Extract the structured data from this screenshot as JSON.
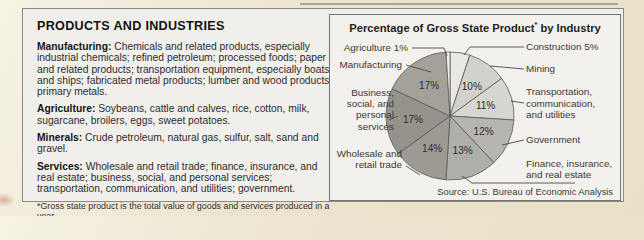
{
  "left_panel": {
    "heading": "PRODUCTS AND INDUSTRIES",
    "sections": [
      {
        "label": "Manufacturing:",
        "text": "Chemicals and related products, especially industrial chemicals; refined petroleum; processed foods; paper and related products; transportation equipment, especially boats and ships; fabricated metal products; lumber and wood products; primary metals."
      },
      {
        "label": "Agriculture:",
        "text": "Soybeans, cattle and calves, rice, cotton, milk, sugarcane, broilers, eggs, sweet potatoes."
      },
      {
        "label": "Minerals:",
        "text": "Crude petroleum, natural gas, sulfur, salt, sand and gravel."
      },
      {
        "label": "Services:",
        "text": "Wholesale and retail trade; finance, insurance, and real estate; business, social, and personal services; transportation, communication, and utilities; government."
      }
    ],
    "footnote": "*Gross state product is the total value of goods and services produced in a year."
  },
  "chart_panel": {
    "title_main": "Percentage of Gross State Product",
    "title_sup": "*",
    "title_rest": " by Industry",
    "source": "Source: U.S. Bureau of Economic Analysis"
  },
  "chart_data": {
    "type": "pie",
    "start_angle_deg": 0,
    "direction": "clockwise",
    "legend_position": "callout-labels",
    "slices": [
      {
        "label": "Construction",
        "value": 5,
        "pct_label": "",
        "external_lines": [
          "Construction 5%"
        ],
        "color": "#eae8e3"
      },
      {
        "label": "Mining",
        "value": 10,
        "pct_label": "10%",
        "external_lines": [
          "Mining"
        ],
        "color": "#d3d1cb"
      },
      {
        "label": "Transportation, communication, and utilities",
        "value": 11,
        "pct_label": "11%",
        "external_lines": [
          "Transportation,",
          "communication,",
          "and utilities"
        ],
        "color": "#d8d6d0"
      },
      {
        "label": "Government",
        "value": 12,
        "pct_label": "12%",
        "external_lines": [
          "Government"
        ],
        "color": "#b7b5af"
      },
      {
        "label": "Finance, insurance, and real estate",
        "value": 13,
        "pct_label": "13%",
        "external_lines": [
          "Finance, insurance,",
          "and real estate"
        ],
        "color": "#b0aea8"
      },
      {
        "label": "Wholesale and retail trade",
        "value": 14,
        "pct_label": "14%",
        "external_lines": [
          "Wholesale and",
          "retail trade"
        ],
        "color": "#9c9a93"
      },
      {
        "label": "Business, social, and personal services",
        "value": 17,
        "pct_label": "17%",
        "external_lines": [
          "Business,",
          "social, and",
          "personal",
          "services"
        ],
        "color": "#95938c"
      },
      {
        "label": "Manufacturing",
        "value": 17,
        "pct_label": "17%",
        "external_lines": [
          "Manufacturing"
        ],
        "color": "#a3a19a"
      },
      {
        "label": "Agriculture",
        "value": 1,
        "pct_label": "",
        "external_lines": [
          "Agriculture 1%"
        ],
        "color": "#f2f1ed"
      }
    ],
    "source": "Source: U.S. Bureau of Economic Analysis"
  }
}
